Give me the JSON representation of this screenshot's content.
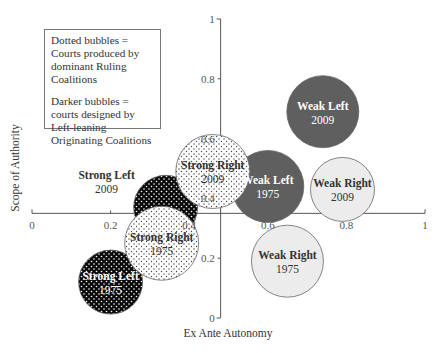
{
  "chart_data": {
    "type": "scatter",
    "subtype": "bubble",
    "title": "",
    "xlabel": "Ex Ante Autonomy",
    "ylabel": "Scope of Authority",
    "xlim": [
      0,
      1
    ],
    "ylim": [
      0,
      1
    ],
    "x_ticks": [
      "0",
      "0.2",
      "0.4",
      "0.6",
      "0.8",
      "1"
    ],
    "y_ticks": [
      "0",
      "0.2",
      "0.4",
      "0.6",
      "0.8",
      "1"
    ],
    "y_axis_crosses_x_at": 0.48,
    "x_axis_crosses_y_at": 0.35,
    "grid": false,
    "legend_notes": [
      "Dotted bubbles = Courts produced by dominant Ruling Coalitions",
      "Darker bubbles = courts designed by Left-leaning Originating Coalitions"
    ],
    "points": [
      {
        "label": "Weak Left",
        "year": "2009",
        "x": 0.74,
        "y": 0.69,
        "r": 36,
        "fill": "#5f5f5f",
        "dotted": false,
        "text_color": "#ffffff"
      },
      {
        "label": "Weak Right",
        "year": "2009",
        "x": 0.79,
        "y": 0.43,
        "r": 32,
        "fill": "#ececec",
        "dotted": false,
        "text_color": "#333333"
      },
      {
        "label": "Weak Right",
        "year": "1975",
        "x": 0.65,
        "y": 0.19,
        "r": 36,
        "fill": "#ececec",
        "dotted": false,
        "text_color": "#333333"
      },
      {
        "label": "Weak Left",
        "year": "1975",
        "x": 0.6,
        "y": 0.44,
        "r": 36,
        "fill": "#5f5f5f",
        "dotted": false,
        "text_color": "#ffffff"
      },
      {
        "label": "Strong Left",
        "year": "2009",
        "x": 0.34,
        "y": 0.37,
        "r": 32,
        "fill": "#0a0a0a",
        "dotted": true,
        "text_color": "#333333",
        "label_outside": true
      },
      {
        "label": "Strong Right",
        "year": "2009",
        "x": 0.46,
        "y": 0.49,
        "r": 37,
        "fill": "#ffffff",
        "dotted": true,
        "text_color": "#333333"
      },
      {
        "label": "Strong Left",
        "year": "1975",
        "x": 0.2,
        "y": 0.12,
        "r": 32,
        "fill": "#0a0a0a",
        "dotted": true,
        "text_color": "#ffffff"
      },
      {
        "label": "Strong Right",
        "year": "1975",
        "x": 0.33,
        "y": 0.25,
        "r": 37,
        "fill": "#ffffff",
        "dotted": true,
        "text_color": "#333333"
      }
    ]
  },
  "legend": {
    "line1": "Dotted bubbles = Courts produced by dominant Ruling Coalitions",
    "line2": "Darker bubbles = courts designed by Left-leaning Originating Coalitions"
  },
  "colors": {
    "axis": "#555555",
    "dark_bubble": "#5f5f5f",
    "black_bubble": "#0a0a0a",
    "light_bubble": "#ececec",
    "dot_on_white": "#444444",
    "dot_on_black": "#ffffff"
  }
}
